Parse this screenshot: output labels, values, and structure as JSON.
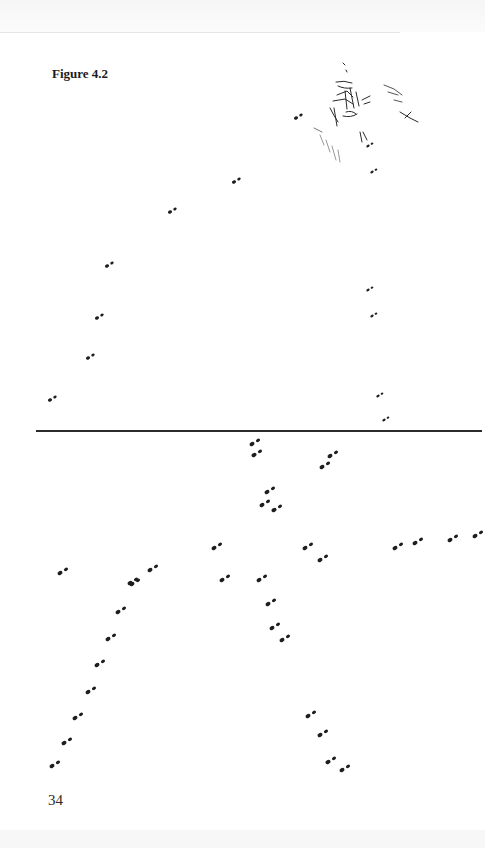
{
  "page": {
    "figure_caption": "Figure 4.2",
    "page_number": "34"
  },
  "figure": {
    "divider_color": "#2b2b2b",
    "ink_color": "#1e1e1e",
    "upper_panel": {
      "diagonal_trail": [
        [
          50,
          400
        ],
        [
          88,
          358
        ],
        [
          97,
          318
        ],
        [
          107,
          266
        ],
        [
          170,
          212
        ],
        [
          234,
          182
        ],
        [
          296,
          118
        ]
      ],
      "vertical_trail": [
        [
          368,
          146
        ],
        [
          372,
          172
        ],
        [
          368,
          290
        ],
        [
          372,
          316
        ],
        [
          378,
          396
        ],
        [
          384,
          420
        ]
      ],
      "cluster_center": [
        350,
        95
      ]
    },
    "lower_panel": {
      "top_tracks": [
        [
          252,
          444
        ],
        [
          254,
          455
        ],
        [
          330,
          456
        ],
        [
          322,
          467
        ]
      ],
      "center_cluster": [
        [
          267,
          492
        ],
        [
          262,
          505
        ],
        [
          274,
          510
        ]
      ],
      "left_trail": [
        [
          60,
          573
        ],
        [
          132,
          584
        ],
        [
          150,
          570
        ],
        [
          214,
          548
        ],
        [
          222,
          580
        ]
      ],
      "right_trail": [
        [
          305,
          548
        ],
        [
          320,
          560
        ],
        [
          395,
          548
        ],
        [
          415,
          543
        ],
        [
          450,
          540
        ],
        [
          475,
          536
        ]
      ],
      "lower_left_diagonal": [
        [
          130,
          583
        ],
        [
          118,
          612
        ],
        [
          108,
          639
        ],
        [
          97,
          665
        ],
        [
          88,
          692
        ],
        [
          75,
          718
        ],
        [
          64,
          743
        ],
        [
          52,
          766
        ]
      ],
      "lower_right_descent": [
        [
          259,
          580
        ],
        [
          268,
          604
        ],
        [
          272,
          628
        ],
        [
          282,
          640
        ],
        [
          308,
          716
        ],
        [
          320,
          735
        ],
        [
          328,
          762
        ],
        [
          342,
          770
        ]
      ]
    }
  }
}
